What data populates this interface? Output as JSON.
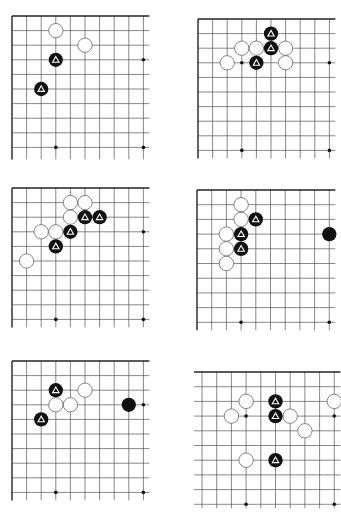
{
  "page": {
    "background": "#ffffff"
  },
  "colors": {
    "line": "#555555",
    "edge": "#222222",
    "black_stone": "#111111",
    "white_stone": "#ffffff",
    "stone_outline": "#666666",
    "marker_on_black": "#ffffff"
  },
  "boards": [
    {
      "id": "board-1",
      "origin": [
        12,
        16
      ],
      "spacing": 14.6,
      "cols": 10,
      "rows": 10,
      "extend_right": 6,
      "extend_bottom": 12,
      "edges": {
        "top": true,
        "left": true
      },
      "star_points": [
        [
          3,
          9
        ],
        [
          9,
          9
        ],
        [
          9,
          3
        ]
      ],
      "white": [
        [
          3,
          1
        ],
        [
          5,
          2
        ]
      ],
      "black": [],
      "black_marked": [
        [
          3,
          3
        ],
        [
          2,
          5
        ]
      ]
    },
    {
      "id": "board-2",
      "origin": [
        198,
        19
      ],
      "spacing": 14.6,
      "cols": 10,
      "rows": 10,
      "extend_right": 6,
      "extend_bottom": 8,
      "edges": {
        "top": true,
        "left": true
      },
      "star_points": [
        [
          3,
          3
        ],
        [
          9,
          3
        ],
        [
          3,
          9
        ],
        [
          9,
          9
        ]
      ],
      "white": [
        [
          3,
          2
        ],
        [
          4,
          2
        ],
        [
          6,
          2
        ],
        [
          2,
          3
        ],
        [
          6,
          3
        ]
      ],
      "black": [],
      "black_marked": [
        [
          5,
          1
        ],
        [
          5,
          2
        ],
        [
          4,
          3
        ]
      ]
    },
    {
      "id": "board-3",
      "origin": [
        12,
        188
      ],
      "spacing": 14.6,
      "cols": 10,
      "rows": 10,
      "extend_right": 6,
      "extend_bottom": 8,
      "edges": {
        "top": true,
        "left": true
      },
      "star_points": [
        [
          9,
          3
        ],
        [
          3,
          9
        ],
        [
          9,
          9
        ]
      ],
      "white": [
        [
          4,
          1
        ],
        [
          5,
          1
        ],
        [
          4,
          2
        ],
        [
          2,
          3
        ],
        [
          3,
          3
        ],
        [
          1,
          5
        ]
      ],
      "black": [],
      "black_marked": [
        [
          5,
          2
        ],
        [
          6,
          2
        ],
        [
          4,
          3
        ],
        [
          3,
          4
        ]
      ]
    },
    {
      "id": "board-4",
      "origin": [
        197,
        190
      ],
      "spacing": 14.7,
      "cols": 10,
      "rows": 10,
      "extend_right": 6,
      "extend_bottom": 8,
      "edges": {
        "top": true,
        "left": true
      },
      "star_points": [
        [
          3,
          9
        ],
        [
          9,
          9
        ]
      ],
      "white": [
        [
          3,
          1
        ],
        [
          3,
          2
        ],
        [
          2,
          3
        ],
        [
          2,
          4
        ],
        [
          2,
          5
        ]
      ],
      "black": [
        [
          9,
          3
        ]
      ],
      "black_marked": [
        [
          4,
          2
        ],
        [
          3,
          3
        ],
        [
          3,
          4
        ]
      ]
    },
    {
      "id": "board-5",
      "origin": [
        12,
        361
      ],
      "spacing": 14.6,
      "cols": 10,
      "rows": 10,
      "extend_right": 6,
      "extend_bottom": 8,
      "edges": {
        "top": true,
        "left": true
      },
      "star_points": [
        [
          9,
          3
        ],
        [
          3,
          9
        ],
        [
          9,
          9
        ]
      ],
      "white": [
        [
          5,
          2
        ],
        [
          3,
          3
        ],
        [
          4,
          3
        ]
      ],
      "black": [
        [
          8,
          3
        ]
      ],
      "black_marked": [
        [
          3,
          2
        ],
        [
          2,
          4
        ]
      ]
    },
    {
      "id": "board-6",
      "origin": [
        202,
        372
      ],
      "spacing": 14.7,
      "cols": 10,
      "rows": 10,
      "extend_left": 8,
      "extend_right": 6,
      "extend_bottom": 4,
      "edges": {
        "top": true,
        "left": false
      },
      "star_points": [
        [
          3,
          3
        ],
        [
          9,
          3
        ],
        [
          3,
          9
        ],
        [
          9,
          9
        ]
      ],
      "white": [
        [
          3,
          2
        ],
        [
          9,
          2
        ],
        [
          2,
          3
        ],
        [
          6,
          3
        ],
        [
          7,
          4
        ],
        [
          3,
          6
        ]
      ],
      "black": [],
      "black_marked": [
        [
          5,
          2
        ],
        [
          5,
          3
        ],
        [
          5,
          6
        ]
      ]
    }
  ],
  "icons": {
    "marker": "triangle-marker"
  }
}
